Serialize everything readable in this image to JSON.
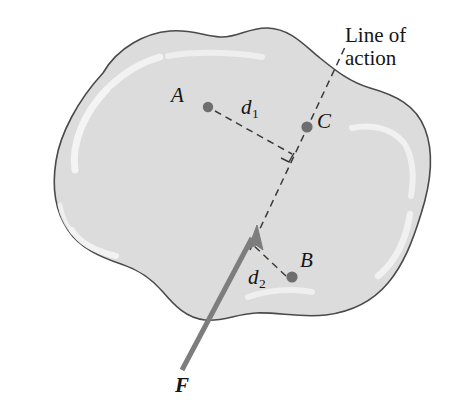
{
  "figure": {
    "type": "mechanics-free-body-diagram",
    "width": 469,
    "height": 418,
    "background_color": "#ffffff"
  },
  "body_shape": {
    "name": "rigid-body-blob",
    "fill_color": "#dcdcdc",
    "stroke_color": "#4a4a4a",
    "highlight_color": "#f2f2f2",
    "stroke_width": 1.6
  },
  "points": [
    {
      "id": "A",
      "label": "A",
      "x": 208,
      "y": 107,
      "label_x": 172,
      "label_y": 86,
      "dot_color": "#6e6e6e",
      "dot_radius": 5.2
    },
    {
      "id": "C",
      "label": "C",
      "x": 307,
      "y": 127,
      "label_x": 317,
      "label_y": 113,
      "dot_color": "#6e6e6e",
      "dot_radius": 5.6
    },
    {
      "id": "B",
      "label": "B",
      "x": 292,
      "y": 277,
      "label_x": 298,
      "label_y": 252,
      "dot_color": "#6e6e6e",
      "dot_radius": 5.6
    }
  ],
  "distances": [
    {
      "id": "d1",
      "label": "d",
      "subscript": "1",
      "label_x": 242,
      "label_y": 100,
      "from_point": "A",
      "to_x": 288,
      "to_y": 152
    },
    {
      "id": "d2",
      "label": "d",
      "subscript": "2",
      "label_x": 249,
      "label_y": 270,
      "from_point": "B",
      "to_x": 254,
      "to_y": 243
    }
  ],
  "force": {
    "label": "F",
    "label_x": 176,
    "label_y": 378,
    "color": "#7d7d7d",
    "stroke_width": 5,
    "tail_x": 184,
    "tail_y": 368,
    "tip_x": 257,
    "tip_y": 228
  },
  "line_of_action": {
    "label_line_1": "Line of",
    "label_line_2": "action",
    "label_x": 345,
    "label_y": 27,
    "color": "#3a3a3a",
    "dash_pattern": "7,5",
    "stroke_width": 1.5,
    "start_x": 255,
    "start_y": 240,
    "end_x": 344,
    "end_y": 48
  },
  "right_angle_mark": {
    "name": "perpendicular-marker",
    "x": 288,
    "y": 152,
    "size": 11,
    "color": "#3a3a3a"
  },
  "colors": {
    "dot": "#6e6e6e",
    "force_arrow": "#7d7d7d",
    "dashed_line": "#3a3a3a",
    "body_fill": "#dcdcdc",
    "body_stroke": "#4a4a4a",
    "text": "#151515"
  }
}
